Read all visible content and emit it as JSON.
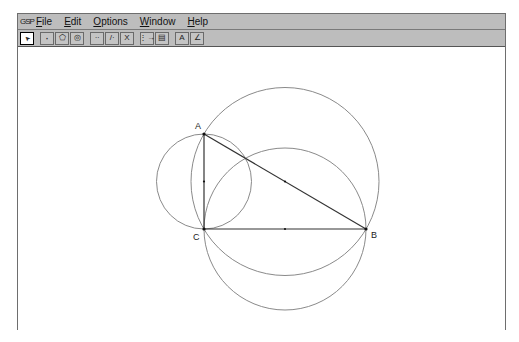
{
  "menubar": {
    "app_icon": "sketchpad-icon",
    "items": [
      {
        "label": "File",
        "mnemonic_index": 0
      },
      {
        "label": "Edit",
        "mnemonic_index": 0
      },
      {
        "label": "Options",
        "mnemonic_index": 0
      },
      {
        "label": "Window",
        "mnemonic_index": 0
      },
      {
        "label": "Help",
        "mnemonic_index": 0
      }
    ]
  },
  "toolbar": {
    "tools": [
      {
        "name": "arrow-select-tool",
        "glyph": "➤",
        "active": true
      },
      {
        "name": "point-tool",
        "glyph": "·"
      },
      {
        "name": "polygon-tool",
        "glyph": "⬠"
      },
      {
        "name": "circle-tool",
        "glyph": "◎"
      },
      {
        "name": "segment-tool",
        "glyph": "∙∙"
      },
      {
        "name": "ray-tool",
        "glyph": "/∙"
      },
      {
        "name": "line-tool",
        "glyph": "X"
      },
      {
        "name": "transform-tool",
        "glyph": "⋮→"
      },
      {
        "name": "measure-tool",
        "glyph": "▤"
      },
      {
        "name": "text-tool",
        "glyph": "A"
      },
      {
        "name": "custom-tool",
        "glyph": "∠"
      }
    ]
  },
  "canvas": {
    "points": [
      {
        "label": "A",
        "x": 204,
        "y": 134
      },
      {
        "label": "B",
        "x": 366,
        "y": 229
      },
      {
        "label": "C",
        "x": 204,
        "y": 229
      }
    ],
    "segments": [
      [
        "A",
        "B"
      ],
      [
        "A",
        "C"
      ],
      [
        "C",
        "B"
      ]
    ],
    "midpoints": [
      {
        "of": "AC",
        "x": 204,
        "y": 181.5
      },
      {
        "of": "AB",
        "x": 285,
        "y": 181.5
      },
      {
        "of": "CB",
        "x": 285,
        "y": 229
      }
    ],
    "circles": [
      {
        "name": "circle-diameter-AC",
        "cx": 204,
        "cy": 181.5,
        "r": 47.5
      },
      {
        "name": "circle-diameter-AB",
        "cx": 285,
        "cy": 181.5,
        "r": 94
      },
      {
        "name": "circle-diameter-CB",
        "cx": 285,
        "cy": 229,
        "r": 81
      }
    ],
    "colors": {
      "circle": "#8a8a8a",
      "segment": "#333333",
      "point": "#111111"
    }
  }
}
